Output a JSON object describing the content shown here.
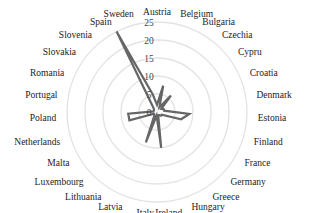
{
  "chart_data": {
    "type": "radar",
    "title": "",
    "categories": [
      "Austria",
      "Belgium",
      "Bulgaria",
      "Czechia",
      "Cypru",
      "Croatia",
      "Denmark",
      "Estonia",
      "Finland",
      "France",
      "Germany",
      "Greece",
      "Hungary",
      "Ireland",
      "Italy",
      "Latvia",
      "Lithuania",
      "Luxembourg",
      "Malta",
      "Netherlands",
      "Poland",
      "Portugal",
      "Romania",
      "Slovakia",
      "Slovenia",
      "Spain",
      "Sweden"
    ],
    "series": [
      {
        "name": "Series 1",
        "values": [
          2,
          7.5,
          1.5,
          6,
          1.5,
          2,
          2,
          9,
          7,
          1.5,
          1.5,
          1,
          1,
          10,
          1,
          9,
          1.5,
          1,
          1,
          8,
          8,
          1,
          1,
          1,
          1.5,
          25,
          5
        ]
      }
    ],
    "radial_axis": {
      "ticks": [
        0,
        5,
        10,
        15,
        20,
        25
      ],
      "range": [
        0,
        25
      ]
    },
    "grid": true,
    "legend": "none",
    "colors": {
      "series": "#666666",
      "grid": "#e3e3e3",
      "text": "#222222"
    }
  }
}
